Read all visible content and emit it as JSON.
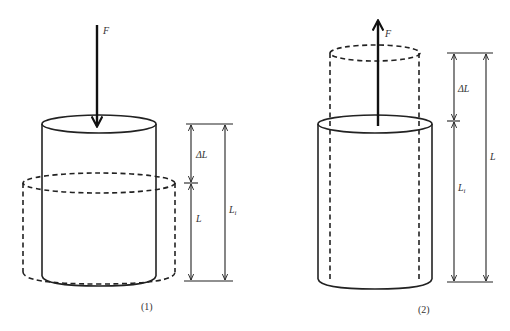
{
  "figure": {
    "colors": {
      "stroke": "#222222",
      "background": "#ffffff",
      "text": "#333333"
    },
    "panels": [
      {
        "id": "compression",
        "caption": "(1)",
        "force": {
          "label": "F",
          "direction": "down"
        },
        "solid_cylinder": "original (uncompressed) shape",
        "dashed_cylinder": "compressed (shorter, wider) shape",
        "dimensions": {
          "delta": {
            "base": "ΔL",
            "sub": ""
          },
          "inner": {
            "base": "L",
            "sub": ""
          },
          "outer": {
            "base": "L",
            "sub": "i"
          }
        }
      },
      {
        "id": "tension",
        "caption": "(2)",
        "force": {
          "label": "F",
          "direction": "up"
        },
        "solid_cylinder": "original (unstretched) shape",
        "dashed_cylinder": "stretched (longer, narrower) shape",
        "dimensions": {
          "delta": {
            "base": "ΔL",
            "sub": ""
          },
          "inner": {
            "base": "L",
            "sub": "i"
          },
          "outer": {
            "base": "L",
            "sub": ""
          }
        }
      }
    ]
  }
}
